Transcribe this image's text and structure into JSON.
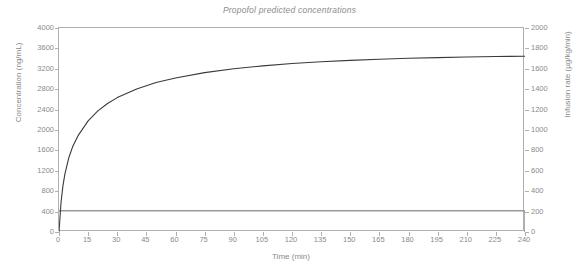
{
  "chart_data": {
    "type": "line",
    "title": "Propofol predicted concentrations",
    "xlabel": "Time (min)",
    "ylabel": "Concentration (ng/mL)",
    "y2label": "Infusion rate (µg/kg/min)",
    "xlim": [
      0,
      240
    ],
    "ylim": [
      0,
      4000
    ],
    "y2lim": [
      0,
      2000
    ],
    "grid": false,
    "legend": "none",
    "xticks": [
      0,
      15,
      30,
      45,
      60,
      75,
      90,
      105,
      120,
      135,
      150,
      165,
      180,
      195,
      210,
      225,
      240
    ],
    "yticks": [
      0,
      400,
      800,
      1200,
      1600,
      2000,
      2400,
      2800,
      3200,
      3600,
      4000
    ],
    "y2ticks": [
      0,
      200,
      400,
      600,
      800,
      1000,
      1200,
      1400,
      1600,
      1800,
      2000
    ],
    "series": [
      {
        "name": "Predicted plasma concentration",
        "axis": "left",
        "color": "#3a3a3a",
        "width": 1.1,
        "x": [
          0,
          1,
          2,
          3,
          5,
          7,
          10,
          15,
          20,
          25,
          30,
          40,
          50,
          60,
          75,
          90,
          105,
          120,
          135,
          150,
          165,
          180,
          195,
          210,
          225,
          240
        ],
        "values": [
          0,
          560,
          900,
          1130,
          1450,
          1670,
          1900,
          2180,
          2375,
          2520,
          2635,
          2805,
          2930,
          3020,
          3125,
          3200,
          3258,
          3303,
          3338,
          3366,
          3388,
          3406,
          3420,
          3431,
          3440,
          3447
        ]
      },
      {
        "name": "Infusion rate",
        "axis": "right",
        "color": "#9a9a9a",
        "width": 1.6,
        "step": true,
        "x": [
          0,
          240,
          240
        ],
        "values": [
          208,
          208,
          0
        ]
      }
    ]
  },
  "axes": {
    "left_title": "Concentration (ng/mL)",
    "right_title": "Infusion rate (µg/kg/min)",
    "bottom_title": "Time (min)"
  },
  "title": "Propofol predicted concentrations",
  "colors": {
    "background": "#ffffff",
    "frame": "#b0b0b0",
    "text": "#8a8a8a",
    "concentration_line": "#3a3a3a",
    "infusion_line": "#9a9a9a"
  }
}
